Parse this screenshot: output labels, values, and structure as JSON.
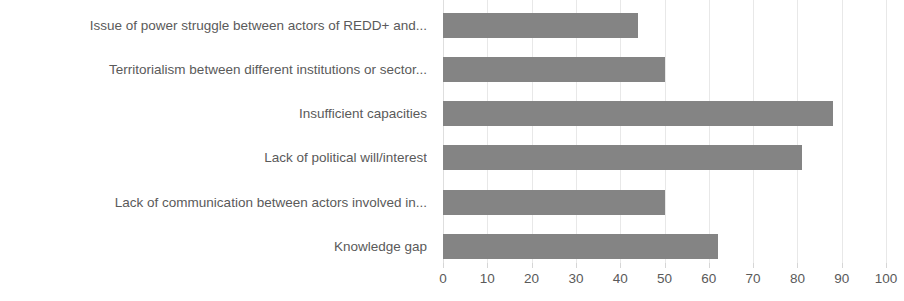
{
  "chart_data": {
    "type": "bar",
    "orientation": "horizontal",
    "title": "",
    "subtitle": "",
    "xlabel": "",
    "ylabel": "",
    "xlim": [
      0,
      100
    ],
    "xticks": [
      0,
      10,
      20,
      30,
      40,
      50,
      60,
      70,
      80,
      90,
      100
    ],
    "xtick_labels": [
      "0",
      "10",
      "20",
      "30",
      "40",
      "50",
      "60",
      "70",
      "80",
      "90",
      "100"
    ],
    "grid": true,
    "grid_axis": "x",
    "legend": false,
    "legend_position": "none",
    "bar_color": "#848484",
    "text_color": "#5a5a5a",
    "gridline_color": "#e8e8e8",
    "background_color": "#ffffff",
    "categories": [
      "Issue of power struggle between actors of REDD+ and...",
      "Territorialism between different institutions or sector...",
      "Insufficient capacities",
      "Lack of political will/interest",
      "Lack of communication between actors involved in...",
      "Knowledge gap"
    ],
    "values": [
      44,
      50,
      88,
      81,
      50,
      62
    ],
    "series": [
      {
        "name": "",
        "values": [
          44,
          50,
          88,
          81,
          50,
          62
        ]
      }
    ],
    "annotations": []
  }
}
